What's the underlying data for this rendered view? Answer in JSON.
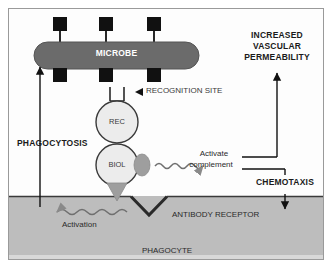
{
  "diagram": {
    "regions": {
      "extracellular_label": "",
      "phagocyte_label": "PHAGOCYTE"
    },
    "microbe": {
      "label": "MICROBE",
      "fill_color": "#6b6b6b",
      "text_color": "#ffffff",
      "antigen_count_top": 3,
      "antigen_count_bottom": 3,
      "antigen_color": "#111111"
    },
    "antibody": {
      "recognition_domain_label": "REC",
      "biological_domain_label": "BIOL",
      "circle_fill": "#ececec",
      "circle_stroke": "#3a3a3a",
      "lobe_fill": "#9e9e9e",
      "tail_fill": "#9e9e9e"
    },
    "annotations": {
      "recognition_site": "RECOGNITION SITE",
      "phagocytosis": "PHAGOCYTOSIS",
      "antibody_receptor": "ANTIBODY RECEPTOR",
      "activation": "Activation",
      "activate_complement_line1": "Activate",
      "activate_complement_line2": "complement",
      "increased_vascular_permeability_line1": "INCREASED",
      "increased_vascular_permeability_line2": "VASCULAR",
      "increased_vascular_permeability_line3": "PERMEABILITY",
      "chemotaxis": "CHEMOTAXIS"
    },
    "colors": {
      "frame_border": "#9a9a9a",
      "background": "#fdfdfd",
      "phagocyte_fill": "#bdbdbd",
      "membrane_line": "#3a3a3a",
      "arrow_stroke": "#111111",
      "wavy_stroke": "#6f6f6f",
      "text_dark": "#1a1a1a"
    }
  }
}
